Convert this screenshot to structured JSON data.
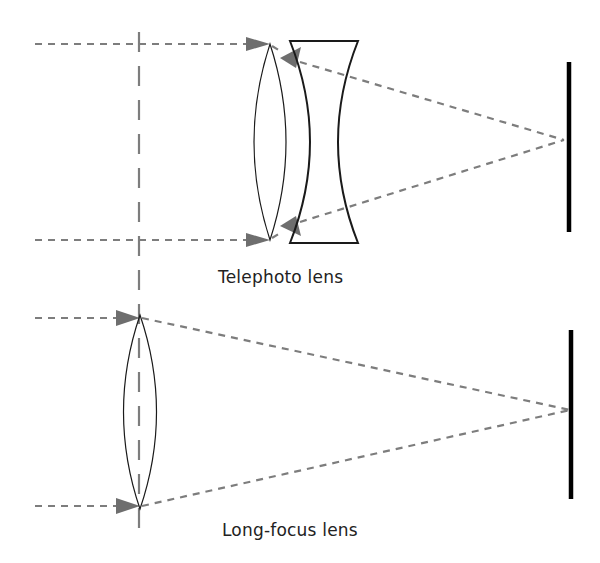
{
  "diagram": {
    "colors": {
      "ray": "#7d7d7d",
      "arrow": "#6e6e6e",
      "lens_outline": "#1a1a1a",
      "screen": "#000000",
      "background": "#ffffff"
    },
    "panels": [
      {
        "id": "telephoto",
        "label": "Telephoto lens",
        "elements": [
          "optical-axis",
          "convex-lens",
          "concave-lens",
          "incoming-rays",
          "converging-rays",
          "image-plane"
        ]
      },
      {
        "id": "long-focus",
        "label": "Long-focus lens",
        "elements": [
          "optical-axis",
          "convex-lens",
          "incoming-rays",
          "converging-rays",
          "image-plane"
        ]
      }
    ]
  }
}
